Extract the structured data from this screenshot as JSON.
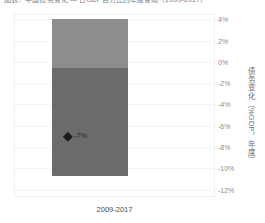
{
  "header": {
    "title": "图表：中国债务变化 — 占GDP百分比的年度变动（2009-2017）"
  },
  "chart_data": {
    "type": "bar",
    "title": "",
    "xlabel": "",
    "ylabel": "债务变化（%GDP，年度）",
    "categories": [
      "2009-2017"
    ],
    "series": [
      {
        "name": "上段",
        "value": 4.6,
        "color": "#8d8d8d"
      },
      {
        "name": "下段",
        "value": -10.7,
        "color": "#6b6b6b"
      }
    ],
    "stack_top": 4.0,
    "stack_split": -0.6,
    "stack_bottom": -10.7,
    "marker": {
      "label": "-7%",
      "value": -7,
      "shape": "diamond",
      "color": "#1a1a1a"
    },
    "yticks": [
      "4%",
      "2%",
      "0%",
      "-2%",
      "-4%",
      "-6%",
      "-8%",
      "-10%",
      "-12%"
    ],
    "ytick_values": [
      4,
      2,
      0,
      -2,
      -4,
      -6,
      -8,
      -10,
      -12
    ],
    "ylim": [
      -12.6,
      4.4
    ],
    "grid": true,
    "legend": "none",
    "axis_position": "right"
  },
  "colors": {
    "bar_upper": "#8d8d8d",
    "bar_lower": "#6b6b6b",
    "marker": "#1a1a1a",
    "frame": "#f0f0f0",
    "tick_text": "#8a8a8f",
    "axis_title_text": "#6f6f75",
    "background": "#ffffff"
  }
}
